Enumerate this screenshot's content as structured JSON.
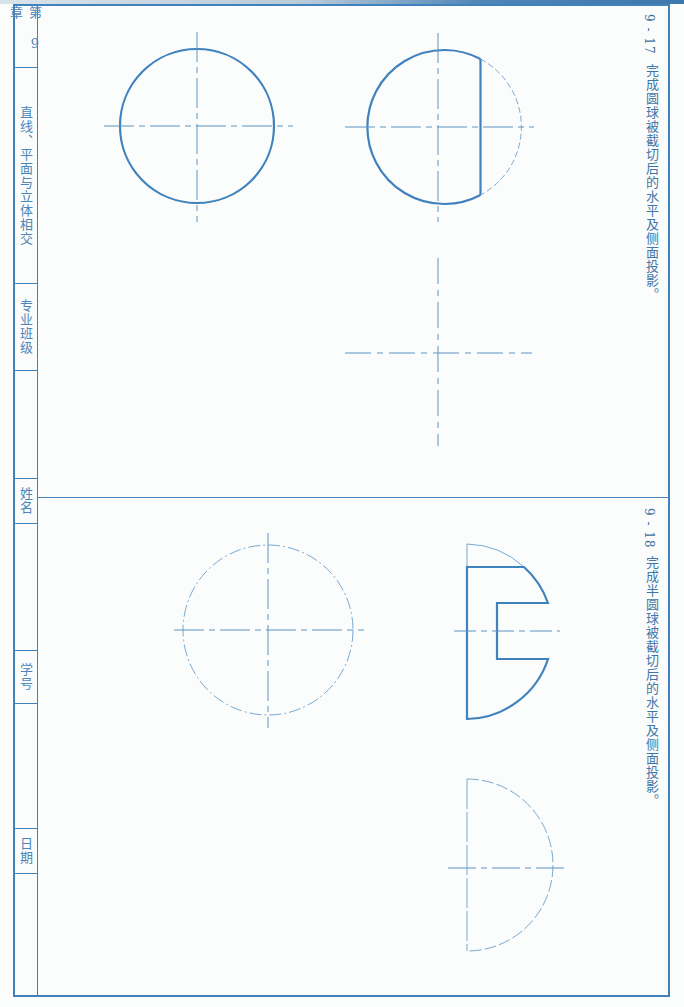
{
  "sidebar": {
    "chapter": "第 9 章",
    "chapter_title": "直线、平面与立体相交",
    "class_label": "专业班级",
    "class_value": "",
    "name_label": "姓名",
    "name_value": "",
    "id_label": "学号",
    "id_value": "",
    "date_label": "日期",
    "date_value": ""
  },
  "exercises": [
    {
      "number": "9 - 17",
      "title": "完成圆球被截切后的水平及侧面投影。"
    },
    {
      "number": "9 - 18",
      "title": "完成半圆球被截切后的水平及侧面投影。"
    }
  ],
  "colors": {
    "line": "#3f82bd",
    "thin_line": "#5b95c6",
    "text": "#4a83b6"
  }
}
